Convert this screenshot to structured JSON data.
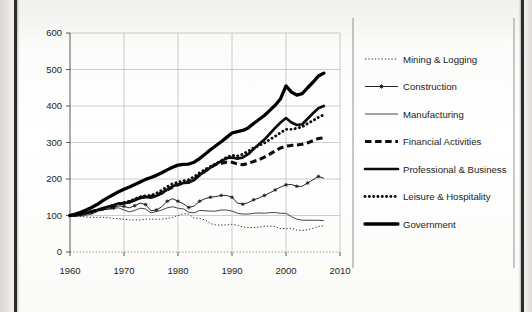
{
  "figure": {
    "title": "",
    "background": "#ffffff",
    "frame_color": "#2e2c2b"
  },
  "axes": {
    "y_ticks": [
      "0",
      "100",
      "200",
      "300",
      "400",
      "500",
      "600"
    ],
    "x_ticks": [
      "1960",
      "1970",
      "1980",
      "1990",
      "2000",
      "2010"
    ],
    "ylim": [
      0,
      600
    ],
    "xlim": [
      1960,
      2010
    ],
    "grid": true
  },
  "legend": {
    "position": "right",
    "entries": [
      {
        "label": "Mining & Logging",
        "style": "fine-dotted",
        "color": "#1a1a1a",
        "width": 0.9,
        "marker": "none"
      },
      {
        "label": "Construction",
        "style": "solid-marker",
        "color": "#1a1a1a",
        "width": 0.9,
        "marker": "star"
      },
      {
        "label": "Manufacturing",
        "style": "thin-solid",
        "color": "#5a5a5a",
        "width": 0.9,
        "marker": "none"
      },
      {
        "label": "Financial Activities",
        "style": "thick-dashed",
        "color": "#111111",
        "width": 3.0,
        "marker": "none"
      },
      {
        "label": "Professional & Business",
        "style": "thick-solid",
        "color": "#111111",
        "width": 2.6,
        "marker": "none"
      },
      {
        "label": "Leisure & Hospitality",
        "style": "thick-dotted",
        "color": "#111111",
        "width": 2.6,
        "marker": "none"
      },
      {
        "label": "Government",
        "style": "extra-thick",
        "color": "#000000",
        "width": 3.2,
        "marker": "none"
      }
    ]
  },
  "chart_data": {
    "type": "line",
    "title": "",
    "xlabel": "",
    "ylabel": "",
    "xlim": [
      1960,
      2010
    ],
    "ylim": [
      0,
      600
    ],
    "grid": true,
    "legend_position": "right",
    "note": "Indexed employment series, 1960 = 100",
    "x": [
      1960,
      1961,
      1962,
      1963,
      1964,
      1965,
      1966,
      1967,
      1968,
      1969,
      1970,
      1971,
      1972,
      1973,
      1974,
      1975,
      1976,
      1977,
      1978,
      1979,
      1980,
      1981,
      1982,
      1983,
      1984,
      1985,
      1986,
      1987,
      1988,
      1989,
      1990,
      1991,
      1992,
      1993,
      1994,
      1995,
      1996,
      1997,
      1998,
      1999,
      2000,
      2001,
      2002,
      2003,
      2004,
      2005,
      2006,
      2007
    ],
    "series": [
      {
        "name": "Mining & Logging",
        "style": "fine-dotted",
        "values": [
          100,
          99,
          98,
          96,
          95,
          95,
          95,
          94,
          92,
          91,
          90,
          88,
          88,
          88,
          90,
          90,
          90,
          90,
          92,
          95,
          100,
          105,
          104,
          93,
          92,
          88,
          78,
          74,
          74,
          74,
          76,
          73,
          69,
          67,
          67,
          68,
          70,
          71,
          70,
          64,
          64,
          65,
          60,
          59,
          61,
          65,
          70,
          72
        ]
      },
      {
        "name": "Construction",
        "style": "solid-marker",
        "values": [
          100,
          98,
          101,
          104,
          108,
          113,
          117,
          117,
          120,
          126,
          125,
          121,
          127,
          134,
          130,
          113,
          115,
          124,
          139,
          146,
          139,
          132,
          122,
          126,
          139,
          146,
          150,
          152,
          155,
          155,
          150,
          134,
          131,
          135,
          143,
          148,
          155,
          162,
          170,
          178,
          184,
          185,
          180,
          180,
          189,
          198,
          207,
          202
        ]
      },
      {
        "name": "Manufacturing",
        "style": "thin-solid",
        "values": [
          100,
          97,
          100,
          101,
          104,
          110,
          117,
          118,
          119,
          121,
          115,
          110,
          114,
          120,
          118,
          107,
          111,
          115,
          121,
          124,
          120,
          118,
          109,
          107,
          114,
          113,
          112,
          112,
          115,
          115,
          112,
          106,
          104,
          104,
          106,
          107,
          106,
          108,
          108,
          106,
          106,
          97,
          90,
          87,
          87,
          87,
          87,
          86
        ]
      },
      {
        "name": "Financial Activities",
        "style": "thick-dashed",
        "values": [
          100,
          102,
          105,
          108,
          111,
          114,
          118,
          122,
          126,
          131,
          134,
          137,
          143,
          149,
          152,
          152,
          156,
          162,
          170,
          178,
          184,
          189,
          192,
          200,
          211,
          221,
          232,
          240,
          243,
          246,
          246,
          241,
          239,
          243,
          248,
          253,
          260,
          268,
          277,
          285,
          290,
          292,
          293,
          295,
          299,
          305,
          311,
          313
        ]
      },
      {
        "name": "Professional & Business",
        "style": "thick-solid",
        "values": [
          100,
          101,
          104,
          107,
          111,
          115,
          120,
          124,
          128,
          133,
          134,
          136,
          142,
          148,
          151,
          149,
          154,
          161,
          171,
          180,
          185,
          189,
          190,
          197,
          211,
          221,
          231,
          240,
          249,
          257,
          259,
          256,
          259,
          268,
          282,
          295,
          308,
          324,
          340,
          355,
          367,
          355,
          348,
          350,
          365,
          380,
          394,
          400
        ]
      },
      {
        "name": "Leisure & Hospitality",
        "style": "thick-dotted",
        "values": [
          100,
          102,
          104,
          107,
          110,
          114,
          119,
          123,
          127,
          132,
          135,
          139,
          145,
          151,
          154,
          155,
          161,
          169,
          179,
          187,
          191,
          195,
          198,
          206,
          217,
          226,
          234,
          242,
          250,
          259,
          265,
          263,
          268,
          276,
          285,
          292,
          299,
          308,
          317,
          327,
          336,
          336,
          339,
          343,
          352,
          360,
          369,
          376
        ]
      },
      {
        "name": "Government",
        "style": "extra-thick",
        "values": [
          100,
          103,
          107,
          112,
          118,
          124,
          134,
          142,
          148,
          154,
          160,
          165,
          170,
          175,
          180,
          184,
          188,
          193,
          199,
          203,
          207,
          206,
          205,
          207,
          212,
          219,
          226,
          232,
          238,
          247,
          256,
          260,
          261,
          263,
          270,
          274,
          277,
          281,
          286,
          293,
          303,
          307,
          309,
          310,
          312,
          315,
          319,
          322
        ]
      }
    ],
    "government_overlay": {
      "comment": "Government plotted as the topmost heavy black curve reaching ~490 at 2007",
      "values": [
        100,
        104,
        109,
        115,
        122,
        130,
        140,
        149,
        157,
        165,
        172,
        178,
        185,
        192,
        199,
        204,
        210,
        217,
        225,
        232,
        238,
        240,
        241,
        246,
        256,
        268,
        280,
        291,
        302,
        314,
        326,
        330,
        333,
        340,
        352,
        363,
        374,
        388,
        402,
        420,
        455,
        438,
        430,
        434,
        450,
        465,
        482,
        490
      ]
    }
  }
}
